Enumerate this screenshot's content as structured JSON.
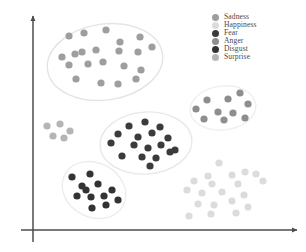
{
  "chart_data": {
    "type": "scatter",
    "title": "",
    "xlabel": "",
    "ylabel": "",
    "grid": false,
    "axes": {
      "style": "arrow",
      "origin": [
        33,
        230
      ],
      "x_end": [
        297,
        230
      ],
      "y_end": [
        33,
        16
      ],
      "ticks": false,
      "tick_labels": [],
      "color": "#4d4d4d"
    },
    "legend": {
      "position": "top-right",
      "entries": [
        {
          "label": "Sadness",
          "color": "#9e9e9e"
        },
        {
          "label": "Happiness",
          "color": "#dcdcdc"
        },
        {
          "label": "Fear",
          "color": "#3b3b3b"
        },
        {
          "label": "Anger",
          "color": "#8e8e8e"
        },
        {
          "label": "Disgust",
          "color": "#333333"
        },
        {
          "label": "Surprise",
          "color": "#b5b5b5"
        }
      ]
    },
    "series": [
      {
        "name": "Sadness",
        "color": "#9e9e9e",
        "hull": {
          "cx": 105,
          "cy": 62,
          "rx": 58,
          "ry": 38,
          "rot": -8,
          "stroke": "#e4e4e4"
        },
        "points": [
          [
            69,
            36
          ],
          [
            84,
            33
          ],
          [
            106,
            30
          ],
          [
            120,
            42
          ],
          [
            140,
            37
          ],
          [
            152,
            47
          ],
          [
            62,
            57
          ],
          [
            75,
            54
          ],
          [
            82,
            52
          ],
          [
            96,
            50
          ],
          [
            119,
            51
          ],
          [
            138,
            52
          ],
          [
            69,
            65
          ],
          [
            88,
            64
          ],
          [
            103,
            62
          ],
          [
            124,
            66
          ],
          [
            141,
            70
          ],
          [
            76,
            79
          ],
          [
            101,
            83
          ],
          [
            118,
            84
          ],
          [
            136,
            79
          ]
        ]
      },
      {
        "name": "Surprise",
        "color": "#b5b5b5",
        "hull": null,
        "points": [
          [
            47,
            126
          ],
          [
            60,
            124
          ],
          [
            70,
            131
          ],
          [
            53,
            136
          ],
          [
            64,
            138
          ]
        ]
      },
      {
        "name": "Anger",
        "color": "#8e8e8e",
        "hull": {
          "cx": 223,
          "cy": 108,
          "rx": 33,
          "ry": 22,
          "rot": -6,
          "stroke": "#efefef"
        },
        "points": [
          [
            240,
            93
          ],
          [
            207,
            100
          ],
          [
            228,
            99
          ],
          [
            248,
            104
          ],
          [
            196,
            109
          ],
          [
            218,
            112
          ],
          [
            233,
            113
          ],
          [
            204,
            119
          ],
          [
            224,
            120
          ],
          [
            245,
            118
          ]
        ]
      },
      {
        "name": "Fear",
        "color": "#3b3b3b",
        "hull": {
          "cx": 146,
          "cy": 143,
          "rx": 46,
          "ry": 31,
          "rot": -4,
          "stroke": "#e8e8e8"
        },
        "points": [
          [
            129,
            126
          ],
          [
            145,
            122
          ],
          [
            160,
            127
          ],
          [
            118,
            134
          ],
          [
            138,
            137
          ],
          [
            152,
            133
          ],
          [
            168,
            138
          ],
          [
            111,
            143
          ],
          [
            134,
            145
          ],
          [
            148,
            148
          ],
          [
            161,
            145
          ],
          [
            175,
            150
          ],
          [
            122,
            156
          ],
          [
            142,
            157
          ],
          [
            156,
            158
          ],
          [
            170,
            152
          ],
          [
            150,
            166
          ]
        ]
      },
      {
        "name": "Disgust",
        "color": "#333333",
        "hull": {
          "cx": 94,
          "cy": 190,
          "rx": 33,
          "ry": 27,
          "rot": 28,
          "stroke": "#ececec"
        },
        "points": [
          [
            72,
            177
          ],
          [
            90,
            174
          ],
          [
            82,
            186
          ],
          [
            98,
            184
          ],
          [
            112,
            190
          ],
          [
            77,
            196
          ],
          [
            91,
            197
          ],
          [
            104,
            196
          ],
          [
            92,
            208
          ],
          [
            106,
            205
          ],
          [
            118,
            200
          ],
          [
            86,
            190
          ]
        ]
      },
      {
        "name": "Happiness",
        "color": "#dcdcdc",
        "hull": null,
        "points": [
          [
            219,
            163
          ],
          [
            245,
            172
          ],
          [
            208,
            176
          ],
          [
            232,
            175
          ],
          [
            256,
            174
          ],
          [
            194,
            181
          ],
          [
            212,
            184
          ],
          [
            238,
            184
          ],
          [
            263,
            181
          ],
          [
            187,
            190
          ],
          [
            202,
            193
          ],
          [
            222,
            192
          ],
          [
            244,
            195
          ],
          [
            198,
            204
          ],
          [
            214,
            205
          ],
          [
            232,
            201
          ],
          [
            248,
            207
          ],
          [
            189,
            216
          ],
          [
            211,
            214
          ],
          [
            236,
            213
          ]
        ]
      }
    ],
    "point_radius": 3.6,
    "xlim": [
      33,
      297
    ],
    "ylim": [
      16,
      230
    ]
  }
}
